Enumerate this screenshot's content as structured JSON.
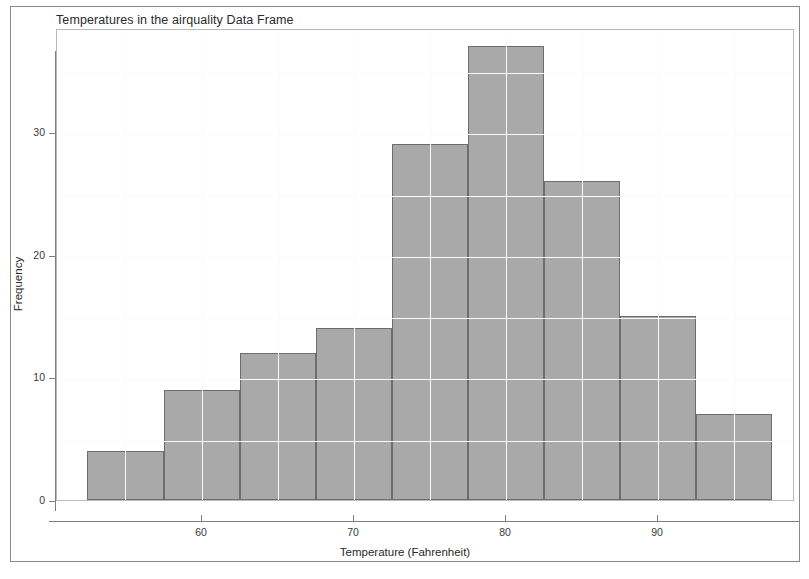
{
  "chart_data": {
    "type": "bar",
    "subtype": "histogram",
    "title": "Temperatures in the airquality Data Frame",
    "xlabel": "Temperature (Fahrenheit)",
    "ylabel": "Frequency",
    "categories": [
      "52.5-57.5",
      "57.5-62.5",
      "62.5-67.5",
      "67.5-72.5",
      "72.5-77.5",
      "77.5-82.5",
      "82.5-87.5",
      "87.5-92.5",
      "92.5-97.5"
    ],
    "bin_edges": [
      52.5,
      57.5,
      62.5,
      67.5,
      72.5,
      77.5,
      82.5,
      87.5,
      92.5,
      97.5
    ],
    "bin_width": 5,
    "values": [
      4,
      9,
      12,
      14,
      29,
      37,
      26,
      15,
      7
    ],
    "xlim": [
      50.5,
      99.0
    ],
    "ylim": [
      0,
      38.5
    ],
    "xticks": [
      60,
      70,
      80,
      90
    ],
    "xtick_labels": [
      "60",
      "70",
      "80",
      "90"
    ],
    "yticks": [
      0,
      10,
      20,
      30
    ],
    "ytick_labels": [
      "0",
      "10",
      "20",
      "30"
    ],
    "grid": true,
    "legend": "none",
    "bar_fill_color": "#a9a9a9",
    "bar_border_color": "#6d6d6d",
    "panel_border_color": "#b9b9b9",
    "grid_color": "#fbfbfb",
    "axis_color": "#7d7d7d",
    "background_color": "#ffffff"
  }
}
